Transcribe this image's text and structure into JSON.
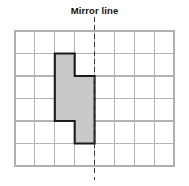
{
  "figure": {
    "title": "Mirror line",
    "kind": "reflection-grid-worksheet"
  },
  "grid": {
    "columns": 8,
    "rows": 6,
    "x0": 15,
    "y0": 31,
    "cell_width": 19.88,
    "cell_height": 22.5,
    "line_color": "#b4b4b4",
    "border_color": "#b0b0b0"
  },
  "mirror_line": {
    "label": "Mirror line",
    "orientation": "vertical",
    "grid_column_index": 4,
    "x": 94.5,
    "y_top": 17,
    "y_bottom": 180,
    "style": "dashed",
    "color": "#3a3a3a"
  },
  "shape": {
    "name": "stepped-polygon",
    "fill_color": "#c9c9c9",
    "stroke_color": "#1c1c1c",
    "points_grid": [
      [
        2,
        1
      ],
      [
        3,
        1
      ],
      [
        3,
        2
      ],
      [
        4,
        2
      ],
      [
        4,
        5
      ],
      [
        3,
        5
      ],
      [
        3,
        4
      ],
      [
        2,
        4
      ]
    ],
    "points_px": "54.8,53.5 74.7,53.5 74.7,76.0 94.6,76.0 94.6,143.5 74.7,143.5 74.7,121.0 54.8,121.0"
  },
  "chart_data": {
    "type": "other",
    "title": "Mirror line",
    "grid_size": [
      8,
      6
    ],
    "mirror_line_column": 4,
    "shape_vertices": [
      [
        2,
        1
      ],
      [
        3,
        1
      ],
      [
        3,
        2
      ],
      [
        4,
        2
      ],
      [
        4,
        5
      ],
      [
        3,
        5
      ],
      [
        3,
        4
      ],
      [
        2,
        4
      ]
    ]
  }
}
